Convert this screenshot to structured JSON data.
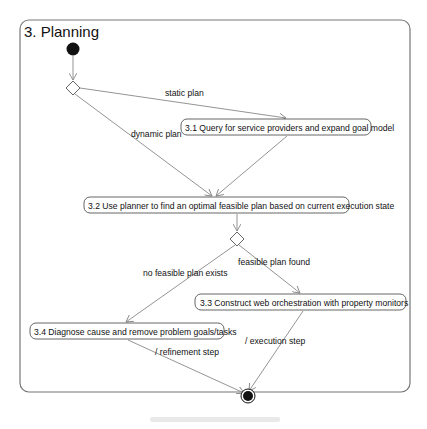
{
  "diagram": {
    "title": "3. Planning",
    "nodes": {
      "n31": "3.1 Query for service providers and expand goal model",
      "n32": "3.2 Use planner to find an optimal feasible plan based on current execution state",
      "n33": "3.3 Construct web orchestration with property monitors",
      "n34": "3.4 Diagnose cause and remove problem goals/tasks"
    },
    "edge_labels": {
      "static_plan": "static plan",
      "dynamic_plan": "dynamic plan",
      "feasible_plan_found": "feasible plan found",
      "no_feasible_plan_exists": "no feasible plan exists",
      "refinement_step": "/ refinement step",
      "execution_step": "/ execution step"
    }
  }
}
